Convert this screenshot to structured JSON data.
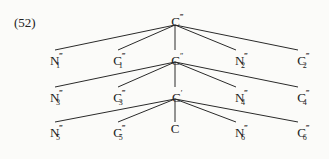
{
  "example_label": "(52)",
  "tree": {
    "root": {
      "base": "C",
      "prime": "‴",
      "sub": ""
    },
    "levels": [
      {
        "nodes": [
          {
            "base": "N",
            "prime": "‴",
            "sub": "1"
          },
          {
            "base": "C",
            "prime": "‴",
            "sub": "1"
          },
          {
            "base": "C",
            "prime": "″",
            "sub": ""
          },
          {
            "base": "N",
            "prime": "‴",
            "sub": "2"
          },
          {
            "base": "C",
            "prime": "‴",
            "sub": "2"
          }
        ]
      },
      {
        "nodes": [
          {
            "base": "N",
            "prime": "‴",
            "sub": "3"
          },
          {
            "base": "C",
            "prime": "‴",
            "sub": "3"
          },
          {
            "base": "C",
            "prime": "′",
            "sub": ""
          },
          {
            "base": "N",
            "prime": "‴",
            "sub": "4"
          },
          {
            "base": "C",
            "prime": "‴",
            "sub": "4"
          }
        ]
      },
      {
        "nodes": [
          {
            "base": "N",
            "prime": "‴",
            "sub": "5"
          },
          {
            "base": "C",
            "prime": "‴",
            "sub": "5"
          },
          {
            "base": "C",
            "prime": "",
            "sub": ""
          },
          {
            "base": "N",
            "prime": "‴",
            "sub": "6"
          },
          {
            "base": "C",
            "prime": "‴",
            "sub": "6"
          }
        ]
      }
    ]
  },
  "colors": {
    "line": "#2a2a2a",
    "text": "#222222",
    "background": "#fbfbf9"
  }
}
